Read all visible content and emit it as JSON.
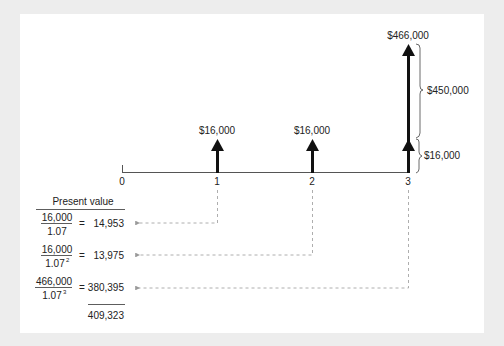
{
  "diagram": {
    "type": "cash-flow-timeline",
    "periods": [
      "0",
      "1",
      "2",
      "3"
    ],
    "cash_flows": [
      {
        "period": "1",
        "label": "$16,000"
      },
      {
        "period": "2",
        "label": "$16,000"
      },
      {
        "period": "3",
        "label": "$466,000"
      }
    ],
    "brace_labels": {
      "principal": "$450,000",
      "coupon": "$16,000"
    },
    "present_value": {
      "header": "Present value",
      "rows": [
        {
          "numerator": "16,000",
          "denominator": "1.07",
          "exponent": "",
          "equals": "=",
          "value": "14,953"
        },
        {
          "numerator": "16,000",
          "denominator": "1.07",
          "exponent": "2",
          "equals": "=",
          "value": "13,975"
        },
        {
          "numerator": "466,000",
          "denominator": "1.07",
          "exponent": "3",
          "equals": "=",
          "value": "380,395"
        }
      ],
      "total": "409,323"
    }
  }
}
